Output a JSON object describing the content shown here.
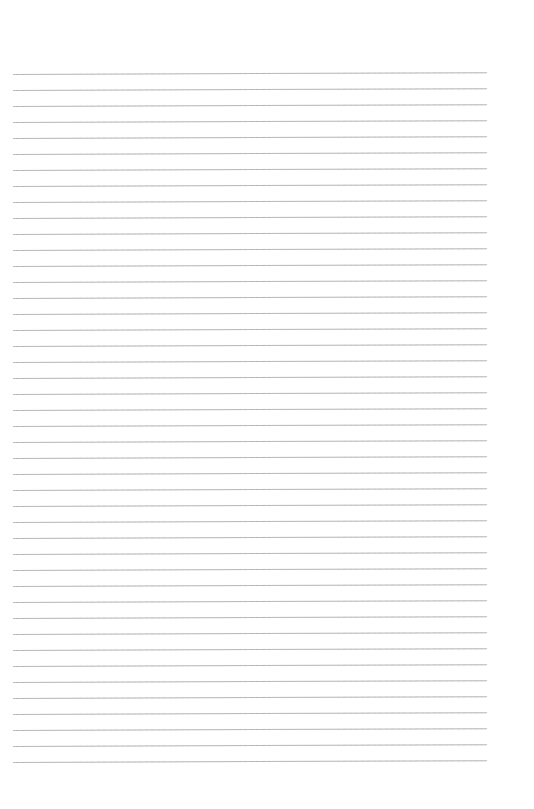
{
  "page": {
    "type": "blank lined paper",
    "background_color": "#ffffff",
    "rule_color": "#b4b4b4",
    "line_count": 44,
    "first_line_y": 74,
    "line_spacing": 16,
    "line_left": 13,
    "line_width": 474
  }
}
